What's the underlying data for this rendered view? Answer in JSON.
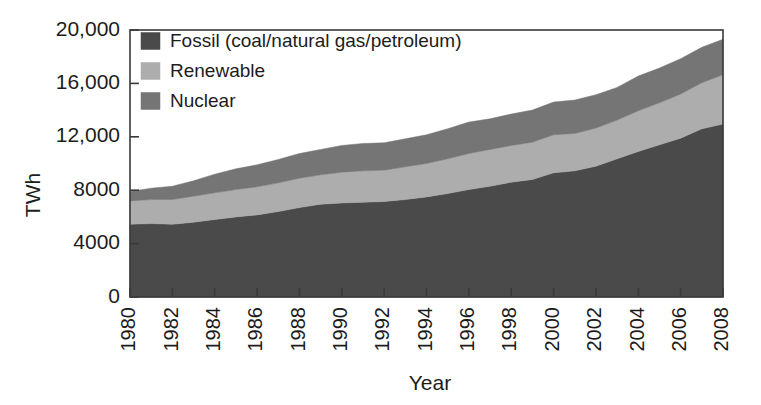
{
  "chart_data": {
    "type": "area",
    "title": "",
    "subtitle": "",
    "xlabel": "Year",
    "ylabel": "TWh",
    "stacked": true,
    "grid": false,
    "legend_position": "top-left-inside",
    "xlim": [
      1980,
      2008
    ],
    "ylim": [
      0,
      20000
    ],
    "ytick_values": [
      0,
      4000,
      8000,
      12000,
      16000,
      20000
    ],
    "ytick_labels": [
      "0",
      "4000",
      "8000",
      "12,000",
      "16,000",
      "20,000"
    ],
    "xtick_values": [
      1980,
      1982,
      1984,
      1986,
      1988,
      1990,
      1992,
      1994,
      1996,
      1998,
      2000,
      2002,
      2004,
      2006,
      2008
    ],
    "xtick_labels": [
      "1980",
      "1982",
      "1984",
      "1986",
      "1988",
      "1990",
      "1992",
      "1994",
      "1996",
      "1998",
      "2000",
      "2002",
      "2004",
      "2006",
      "2008"
    ],
    "x": [
      1980,
      1981,
      1982,
      1983,
      1984,
      1985,
      1986,
      1987,
      1988,
      1989,
      1990,
      1991,
      1992,
      1993,
      1994,
      1995,
      1996,
      1997,
      1998,
      1999,
      2000,
      2001,
      2002,
      2003,
      2004,
      2005,
      2006,
      2007,
      2008
    ],
    "series": [
      {
        "name": "Fossil (coal/natural gas/petroleum)",
        "color": "#4a4a4a",
        "values": [
          5450,
          5500,
          5450,
          5600,
          5800,
          6000,
          6150,
          6400,
          6700,
          6950,
          7050,
          7100,
          7150,
          7300,
          7500,
          7750,
          8050,
          8300,
          8600,
          8800,
          9300,
          9450,
          9800,
          10350,
          10900,
          11400,
          11900,
          12600,
          12950
        ]
      },
      {
        "name": "Renewable",
        "color": "#adadad",
        "values": [
          1750,
          1800,
          1850,
          1950,
          2000,
          2050,
          2100,
          2150,
          2200,
          2200,
          2300,
          2350,
          2350,
          2450,
          2500,
          2600,
          2700,
          2750,
          2750,
          2800,
          2850,
          2800,
          2850,
          2900,
          3050,
          3150,
          3300,
          3450,
          3700
        ]
      },
      {
        "name": "Nuclear",
        "color": "#757575",
        "values": [
          700,
          850,
          1000,
          1150,
          1400,
          1550,
          1650,
          1750,
          1850,
          1900,
          2000,
          2050,
          2050,
          2100,
          2150,
          2250,
          2350,
          2300,
          2350,
          2400,
          2450,
          2500,
          2500,
          2450,
          2600,
          2600,
          2650,
          2650,
          2650
        ]
      }
    ],
    "totals_note": "stacked order bottom-to-top: Fossil, Renewable, Nuclear"
  },
  "legend": {
    "items": [
      {
        "label": "Fossil (coal/natural gas/petroleum)",
        "color": "#4a4a4a"
      },
      {
        "label": "Renewable",
        "color": "#adadad"
      },
      {
        "label": "Nuclear",
        "color": "#757575"
      }
    ]
  },
  "axes": {
    "y_title": "TWh",
    "x_title": "Year"
  }
}
